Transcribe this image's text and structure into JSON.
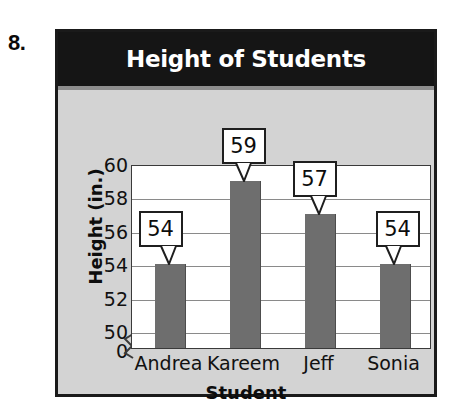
{
  "problem": {
    "number": "8."
  },
  "chart": {
    "title": "Height of Students",
    "x_axis_title": "Student",
    "y_axis_title": "Height (in.)"
  },
  "chart_data": {
    "type": "bar",
    "title": "Height of Students",
    "xlabel": "Student",
    "ylabel": "Height (in.)",
    "categories": [
      "Andrea",
      "Kareem",
      "Jeff",
      "Sonia"
    ],
    "values": [
      54,
      59,
      57,
      54
    ],
    "value_labels": [
      "54",
      "59",
      "57",
      "54"
    ],
    "ytick_labels": [
      "60",
      "58",
      "56",
      "54",
      "52",
      "50",
      "0"
    ],
    "ytick_values": [
      60,
      58,
      56,
      54,
      52,
      50,
      0
    ],
    "ylim": [
      49,
      60
    ],
    "axis_break": true,
    "grid": true,
    "legend": false,
    "bar_color": "#6e6e6e",
    "plot_background": "#ffffff",
    "card_background": "#d3d3d3",
    "title_banner_color": "#151515",
    "title_text_color": "#ffffff"
  }
}
